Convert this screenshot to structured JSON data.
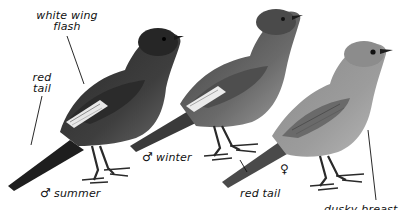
{
  "illustration": {
    "subject": "Black Redstart plumages",
    "style": "monochrome field-guide painting",
    "colors": {
      "background": "#ffffff",
      "male_summer_body": "#3a3a3a",
      "male_summer_head": "#262626",
      "male_winter_body": "#6e6e6e",
      "male_winter_head": "#4a4a4a",
      "female_body": "#9a9a9a",
      "female_head": "#8c8c8c",
      "wing_flash": "#e8e8e8",
      "legs": "#2a2a2a",
      "ink": "#111111"
    }
  },
  "birds": [
    {
      "id": "male-summer",
      "symbol": "♂",
      "caption": "summer"
    },
    {
      "id": "male-winter",
      "symbol": "♂",
      "caption": "winter"
    },
    {
      "id": "female",
      "symbol": "♀",
      "caption": ""
    }
  ],
  "annotations": {
    "white_wing_flash_line1": "white wing",
    "white_wing_flash_line2": "flash",
    "red_tail_male_line1": "red",
    "red_tail_male_line2": "tail",
    "red_tail_female": "red tail",
    "dusky_breast": "dusky breast"
  }
}
